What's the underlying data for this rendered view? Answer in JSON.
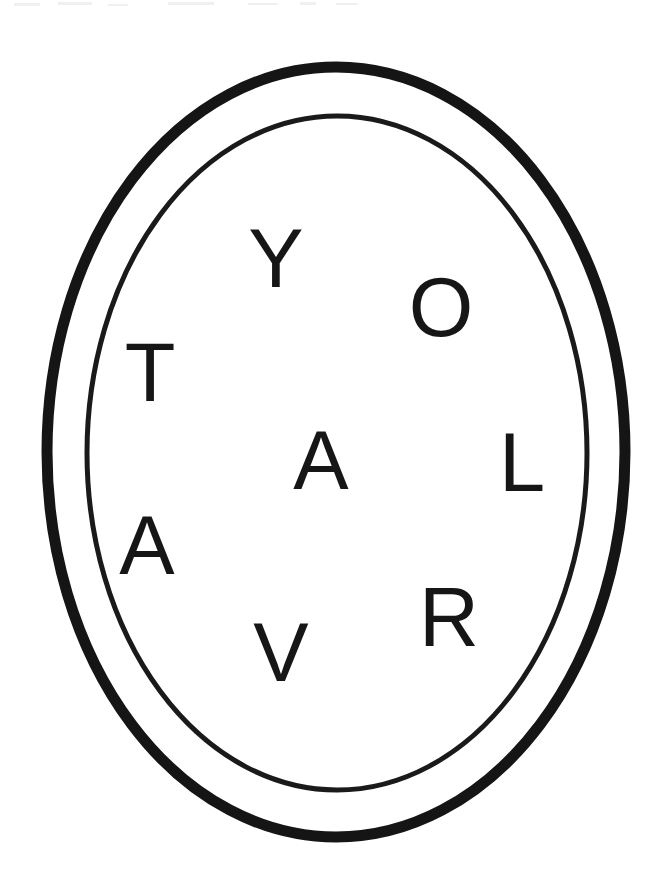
{
  "artwork": {
    "kind": "emblem-logo",
    "title": "Oval monogram emblem",
    "background_color": "#ffffff",
    "ink_color": "#161616",
    "canvas": {
      "width": 671,
      "height": 884
    }
  },
  "rings": {
    "outer": {
      "name": "outer-oval-ring",
      "center_x": 336,
      "center_y": 452,
      "radius_x": 289,
      "radius_y": 385,
      "stroke_width": 11,
      "stroke_color": "#151515"
    },
    "inner": {
      "name": "inner-oval-ring",
      "center_x": 337,
      "center_y": 453,
      "radius_x": 250,
      "radius_y": 337,
      "stroke_width": 5,
      "stroke_color": "#1a1a1a"
    }
  },
  "letters": [
    {
      "char": "Y",
      "name": "letter-y",
      "x": 276,
      "y": 258,
      "size": 83
    },
    {
      "char": "O",
      "name": "letter-o",
      "x": 441,
      "y": 307,
      "size": 83
    },
    {
      "char": "T",
      "name": "letter-t",
      "x": 150,
      "y": 372,
      "size": 83
    },
    {
      "char": "A",
      "name": "letter-a-middle",
      "x": 321,
      "y": 460,
      "size": 83
    },
    {
      "char": "L",
      "name": "letter-l",
      "x": 522,
      "y": 462,
      "size": 83
    },
    {
      "char": "A",
      "name": "letter-a-lower",
      "x": 147,
      "y": 545,
      "size": 83
    },
    {
      "char": "R",
      "name": "letter-r",
      "x": 449,
      "y": 617,
      "size": 83
    },
    {
      "char": "V",
      "name": "letter-v",
      "x": 281,
      "y": 652,
      "size": 83
    }
  ],
  "reading": {
    "sequence": "T Y O L A V A R",
    "note": "letters scattered inside the oval"
  },
  "specks": [
    {
      "x": 14,
      "y": 3,
      "w": 26,
      "h": 3
    },
    {
      "x": 58,
      "y": 2,
      "w": 34,
      "h": 3
    },
    {
      "x": 108,
      "y": 4,
      "w": 20,
      "h": 2
    },
    {
      "x": 168,
      "y": 2,
      "w": 46,
      "h": 3
    },
    {
      "x": 248,
      "y": 3,
      "w": 30,
      "h": 2
    },
    {
      "x": 300,
      "y": 2,
      "w": 16,
      "h": 3
    },
    {
      "x": 336,
      "y": 3,
      "w": 22,
      "h": 2
    }
  ]
}
